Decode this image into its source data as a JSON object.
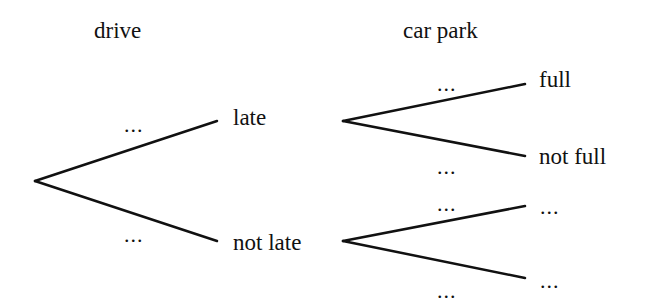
{
  "headers": {
    "stage1": "drive",
    "stage2": "car park"
  },
  "stage1": {
    "upper": {
      "outcome": "late",
      "probability": "..."
    },
    "lower": {
      "outcome": "not late",
      "probability": "..."
    }
  },
  "stage2": {
    "after_late": {
      "upper": {
        "outcome": "full",
        "probability": "..."
      },
      "lower": {
        "outcome": "not full",
        "probability": "..."
      }
    },
    "after_not_late": {
      "upper": {
        "outcome": "...",
        "probability": "..."
      },
      "lower": {
        "outcome": "...",
        "probability": "..."
      }
    }
  },
  "colors": {
    "line": "#111111",
    "text": "#111111",
    "background": "#ffffff"
  }
}
